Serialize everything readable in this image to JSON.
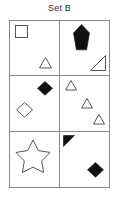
{
  "title": "Set B",
  "colors": {
    "stroke": "#555555",
    "fill_dark": "#111111",
    "grid_line": "#8a8a8a",
    "background": "#ffffff",
    "title_text": "#2b2b2b"
  },
  "grid": {
    "rows": 3,
    "columns": 2,
    "cells": [
      {
        "id": "cell-1",
        "row": 1,
        "column": 1,
        "shapes": [
          {
            "name": "square-outline",
            "type": "square",
            "fill": "none",
            "x": 5,
            "y": 4,
            "size": 13
          },
          {
            "name": "triangle-outline",
            "type": "triangle",
            "fill": "none",
            "x": 29,
            "y": 36,
            "size": 13
          }
        ]
      },
      {
        "id": "cell-2",
        "row": 1,
        "column": 2,
        "shapes": [
          {
            "name": "diamond-filled-tall",
            "type": "diamond-tall",
            "fill": "solid",
            "x": 13,
            "y": 3,
            "size": 17
          },
          {
            "name": "right-triangle-outline",
            "type": "right-triangle",
            "fill": "none",
            "x": 30,
            "y": 34,
            "size": 16
          }
        ]
      },
      {
        "id": "cell-3",
        "row": 2,
        "column": 1,
        "shapes": [
          {
            "name": "diamond-filled",
            "type": "diamond",
            "fill": "solid",
            "x": 27,
            "y": 5,
            "size": 16
          },
          {
            "name": "diamond-outline",
            "type": "diamond",
            "fill": "none",
            "x": 6,
            "y": 26,
            "size": 17
          }
        ]
      },
      {
        "id": "cell-4",
        "row": 2,
        "column": 2,
        "shapes": [
          {
            "name": "triangle-outline",
            "type": "triangle",
            "fill": "none",
            "x": 5,
            "y": 4,
            "size": 12
          },
          {
            "name": "triangle-outline",
            "type": "triangle",
            "fill": "none",
            "x": 21,
            "y": 22,
            "size": 12
          },
          {
            "name": "triangle-outline",
            "type": "triangle",
            "fill": "none",
            "x": 33,
            "y": 38,
            "size": 12
          }
        ]
      },
      {
        "id": "cell-5",
        "row": 3,
        "column": 1,
        "shapes": [
          {
            "name": "star-outline",
            "type": "star",
            "fill": "none",
            "x": 5,
            "y": 8,
            "size": 36
          }
        ]
      },
      {
        "id": "cell-6",
        "row": 3,
        "column": 2,
        "shapes": [
          {
            "name": "right-triangle-filled",
            "type": "right-triangle-flipped",
            "fill": "solid",
            "x": 3,
            "y": 3,
            "size": 12
          },
          {
            "name": "diamond-filled",
            "type": "diamond",
            "fill": "solid",
            "x": 27,
            "y": 30,
            "size": 17
          }
        ]
      }
    ]
  }
}
